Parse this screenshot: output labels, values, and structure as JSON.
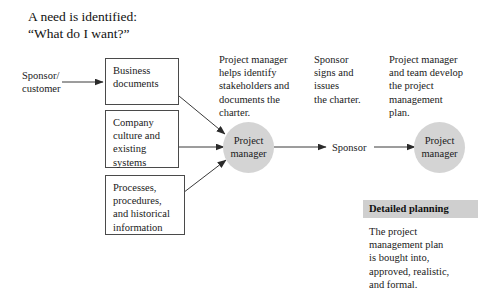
{
  "title": {
    "line1": "A need is identified:",
    "line2": "“What do I want?”"
  },
  "labels": {
    "sponsor_customer": "Sponsor/\ncustomer",
    "sponsor_mid": "Sponsor"
  },
  "source_boxes": [
    {
      "id": "business-documents",
      "text": "Business\ndocuments"
    },
    {
      "id": "company-culture",
      "text": "Company\nculture and\nexisting\nsystems"
    },
    {
      "id": "processes-procedures",
      "text": "Processes,\nprocedures,\nand historical\ninformation"
    }
  ],
  "narratives": [
    {
      "id": "pm-charter",
      "text": "Project manager\nhelps identify\nstakeholders and\ndocuments the\ncharter."
    },
    {
      "id": "sponsor-signs",
      "text": "Sponsor\nsigns and\nissues\nthe charter."
    },
    {
      "id": "pm-team-plan",
      "text": "Project manager\nand team develop\nthe project\nmanagement\nplan."
    }
  ],
  "nodes": [
    {
      "id": "project-manager-1",
      "text": "Project\nmanager"
    },
    {
      "id": "project-manager-2",
      "text": "Project\nmanager"
    }
  ],
  "callout": {
    "header": "Detailed planning",
    "body": "The project\nmanagement plan\nis bought into,\napproved, realistic,\nand formal."
  },
  "colors": {
    "node_fill": "#d4d4d4",
    "callout_header_bg": "#cfcfcf",
    "box_border": "#4a4a4a",
    "stroke": "#3a3a3a",
    "text": "#1a1a1a"
  }
}
